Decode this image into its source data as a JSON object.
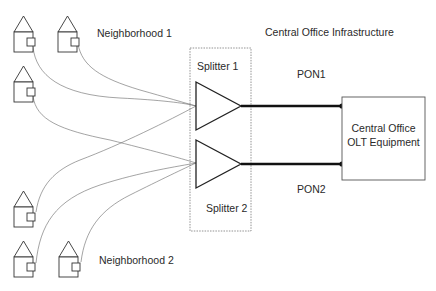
{
  "diagram": {
    "title": "Central Office Infrastructure",
    "neighborhoods": [
      {
        "label": "Neighborhood 1",
        "houses": 3
      },
      {
        "label": "Neighborhood 2",
        "houses": 3
      }
    ],
    "splitters": [
      {
        "label": "Splitter 1",
        "pon": "PON1"
      },
      {
        "label": "Splitter 2",
        "pon": "PON2"
      }
    ],
    "olt": {
      "line1": "Central Office",
      "line2": "OLT Equipment"
    },
    "icons": {
      "house": "house-icon",
      "splitter": "triangle-splitter-icon"
    },
    "colors": {
      "line": "#333333",
      "thin_line": "#555555",
      "background": "#ffffff"
    }
  }
}
